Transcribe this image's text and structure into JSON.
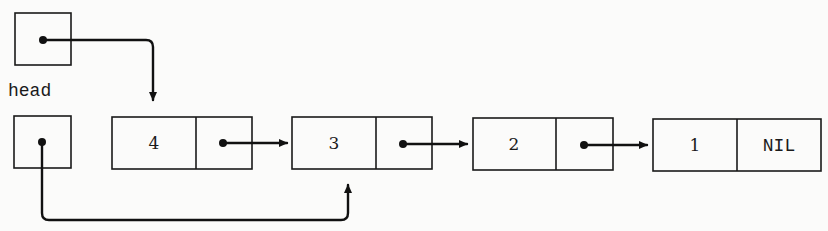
{
  "diagram": {
    "type": "singly-linked-list",
    "label": "head",
    "nodes": [
      {
        "key": "4",
        "next": "3"
      },
      {
        "key": "3",
        "next": "2"
      },
      {
        "key": "2",
        "next": "1"
      },
      {
        "key": "1",
        "next": "NIL"
      }
    ],
    "nil_label": "NIL",
    "pointers": {
      "top_pointer_target": "4",
      "head_pointer_target": "3"
    },
    "colors": {
      "background": "#fbfbfa",
      "ink": "#111111"
    }
  }
}
